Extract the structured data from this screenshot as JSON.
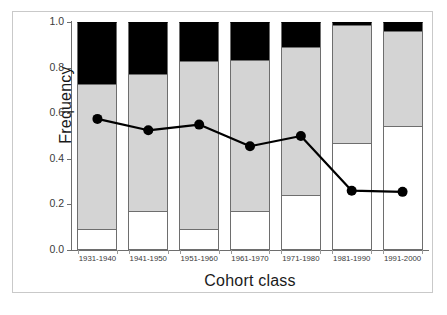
{
  "chart_data": {
    "type": "bar",
    "subtype": "stacked-bar-with-line-overlay",
    "title": "",
    "xlabel": "Cohort class",
    "ylabel": "Frequency",
    "categories": [
      "1931-1940",
      "1941-1950",
      "1951-1960",
      "1961-1970",
      "1971-1980",
      "1981-1990",
      "1991-2000"
    ],
    "ylim": [
      0.0,
      1.0
    ],
    "xlim_note": "categorical, 7 cohort classes",
    "ytick_labels": [
      "0.0",
      "0.2",
      "0.4",
      "0.6",
      "0.8",
      "1.0"
    ],
    "ytick_values": [
      0.0,
      0.2,
      0.4,
      0.6,
      0.8,
      1.0
    ],
    "grid": false,
    "legend": "none",
    "legend_position": "none",
    "series": [
      {
        "name": "white-segment",
        "kind": "stacked-bar",
        "color": "#ffffff",
        "values": [
          0.09,
          0.17,
          0.09,
          0.17,
          0.24,
          0.47,
          0.545
        ]
      },
      {
        "name": "gray-segment",
        "kind": "stacked-bar",
        "color": "#d4d4d4",
        "values": [
          0.64,
          0.6,
          0.74,
          0.665,
          0.65,
          0.515,
          0.415
        ]
      },
      {
        "name": "black-segment",
        "kind": "stacked-bar",
        "color": "#000000",
        "values": [
          0.27,
          0.23,
          0.17,
          0.165,
          0.11,
          0.015,
          0.04
        ]
      },
      {
        "name": "line-overlay",
        "kind": "line-marker",
        "color": "#000000",
        "marker": "filled-circle",
        "values": [
          0.575,
          0.525,
          0.55,
          0.455,
          0.5,
          0.26,
          0.255
        ]
      }
    ],
    "cumulative_tops": {
      "white_top": [
        0.09,
        0.17,
        0.09,
        0.17,
        0.24,
        0.47,
        0.545
      ],
      "gray_top": [
        0.73,
        0.77,
        0.83,
        0.835,
        0.89,
        0.985,
        0.96
      ],
      "black_top": [
        1.0,
        1.0,
        1.0,
        1.0,
        1.0,
        1.0,
        1.0
      ]
    }
  },
  "axes": {
    "y_title": "Frequency",
    "x_title": "Cohort class"
  }
}
